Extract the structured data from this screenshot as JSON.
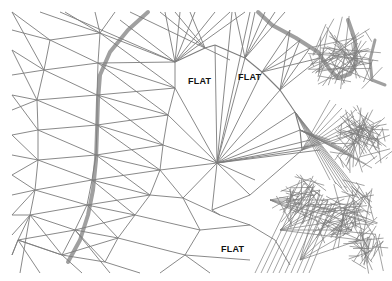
{
  "diagram": {
    "type": "TIN (triangulated irregular network) with contour lines",
    "labels": [
      {
        "text": "FLAT",
        "x": 188,
        "y": 77
      },
      {
        "text": "FLAT",
        "x": 238,
        "y": 73
      },
      {
        "text": "FLAT",
        "x": 221,
        "y": 245
      }
    ],
    "colors": {
      "background": "#ffffff",
      "edge": "#7a7a7a",
      "contour": "#9a9a9a",
      "label": "#111111"
    }
  }
}
